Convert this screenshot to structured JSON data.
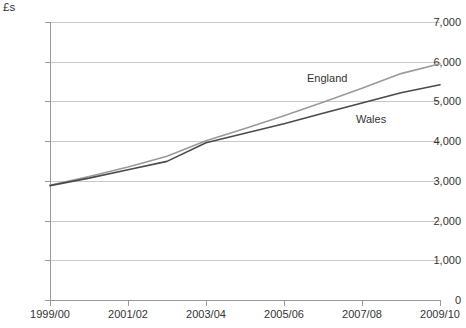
{
  "chart_data": {
    "type": "line",
    "title": "",
    "subtitle": "",
    "xlabel": "",
    "ylabel": "£s",
    "unit_label": "£s",
    "grid": true,
    "legend_position": "inline-labels",
    "ylim": [
      0,
      7000
    ],
    "ytick_labels": [
      "7,000",
      "6,000",
      "5,000",
      "4,000",
      "3,000",
      "2,000",
      "1,000",
      "0"
    ],
    "ytick_values": [
      7000,
      6000,
      5000,
      4000,
      3000,
      2000,
      1000,
      0
    ],
    "xtick_labels": [
      "1999/00",
      "2001/02",
      "2003/04",
      "2005/06",
      "2007/08",
      "2009/10"
    ],
    "x": [
      "1999/00",
      "2000/01",
      "2001/02",
      "2002/03",
      "2003/04",
      "2004/05",
      "2005/06",
      "2006/07",
      "2007/08",
      "2008/09",
      "2009/10"
    ],
    "series": [
      {
        "name": "England",
        "color": "#9a9a9a",
        "values": [
          2890,
          3110,
          3350,
          3620,
          4010,
          4320,
          4640,
          4980,
          5330,
          5700,
          5950
        ]
      },
      {
        "name": "Wales",
        "color": "#4a4a4a",
        "values": [
          2880,
          3070,
          3280,
          3490,
          3960,
          4200,
          4440,
          4700,
          4960,
          5220,
          5420
        ]
      }
    ],
    "annotations": [
      {
        "text": "England",
        "series": "England"
      },
      {
        "text": "Wales",
        "series": "Wales"
      }
    ]
  },
  "caption": {
    "text": ""
  },
  "colors": {
    "england_line": "#9a9a9a",
    "wales_line": "#4a4a4a",
    "gridline": "#c9c9c9",
    "axis": "#9a9a9a",
    "text": "#333333"
  }
}
